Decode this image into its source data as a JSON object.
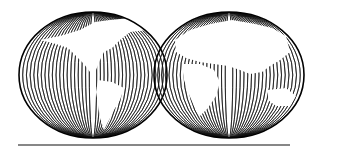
{
  "figure": {
    "hemispheres": [
      {
        "name": "western-hemisphere",
        "continents": [
          "North America",
          "South America",
          "Greenland"
        ],
        "cx": 93,
        "cy": 75,
        "rx": 74,
        "ry": 63
      },
      {
        "name": "eastern-hemisphere",
        "continents": [
          "Europe",
          "Africa",
          "Asia",
          "Australia"
        ],
        "cx": 229,
        "cy": 75,
        "rx": 75,
        "ry": 63
      }
    ],
    "baseline": {
      "x1": 18,
      "x2": 290,
      "y": 145
    },
    "colors": {
      "line": "#111111",
      "land": "#ffffff",
      "background": "#ffffff"
    }
  }
}
